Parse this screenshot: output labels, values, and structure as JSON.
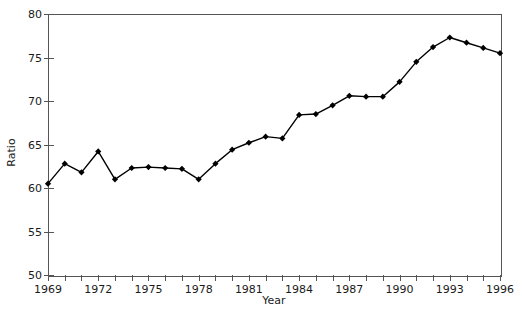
{
  "chart_data": {
    "type": "line",
    "title": "",
    "xlabel": "Year",
    "ylabel": "Ratio",
    "xlim": [
      1969,
      1996
    ],
    "ylim": [
      50,
      80
    ],
    "xticks": [
      1969,
      1970,
      1971,
      1972,
      1973,
      1974,
      1975,
      1976,
      1977,
      1978,
      1979,
      1980,
      1981,
      1982,
      1983,
      1984,
      1985,
      1986,
      1987,
      1988,
      1989,
      1990,
      1991,
      1992,
      1993,
      1994,
      1995,
      1996
    ],
    "xtick_labels": [
      "1969",
      "",
      "",
      "1972",
      "",
      "",
      "1975",
      "",
      "",
      "1978",
      "",
      "",
      "1981",
      "",
      "",
      "1984",
      "",
      "",
      "1987",
      "",
      "",
      "1990",
      "",
      "",
      "1993",
      "",
      "",
      "1996"
    ],
    "yticks": [
      50,
      55,
      60,
      65,
      70,
      75,
      80
    ],
    "ytick_labels": [
      "50",
      "55",
      "60",
      "65",
      "70",
      "75",
      "80"
    ],
    "grid": false,
    "legend": null,
    "marker": "diamond",
    "line_color": "#000000",
    "marker_color": "#000000",
    "axis_color": "#555555",
    "background": "#ffffff",
    "x": [
      1969,
      1970,
      1971,
      1972,
      1973,
      1974,
      1975,
      1976,
      1977,
      1978,
      1979,
      1980,
      1981,
      1982,
      1983,
      1984,
      1985,
      1986,
      1987,
      1988,
      1989,
      1990,
      1991,
      1992,
      1993,
      1994,
      1995,
      1996
    ],
    "values": [
      60.5,
      62.8,
      61.8,
      64.2,
      61.0,
      62.3,
      62.4,
      62.3,
      62.2,
      61.0,
      62.8,
      64.4,
      65.2,
      65.9,
      65.7,
      68.4,
      68.5,
      69.5,
      70.6,
      70.5,
      70.5,
      72.2,
      74.5,
      76.2,
      77.3,
      76.7,
      76.1,
      75.5
    ],
    "series_name": "Ratio"
  }
}
